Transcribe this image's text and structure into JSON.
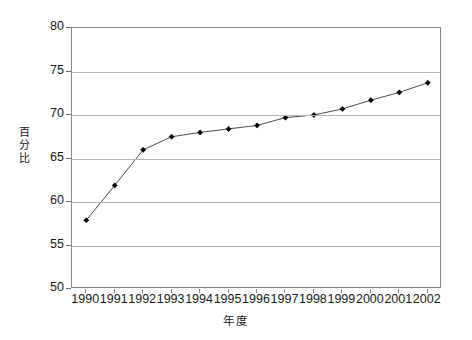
{
  "chart_data": {
    "type": "line",
    "title": "",
    "xlabel": "年度",
    "ylabel": "百分比",
    "categories": [
      "1990",
      "1991",
      "1992",
      "1993",
      "1994",
      "1995",
      "1996",
      "1997",
      "1998",
      "1999",
      "2000",
      "2001",
      "2002"
    ],
    "values": [
      57.9,
      61.9,
      66.0,
      67.5,
      68.0,
      68.4,
      68.8,
      69.7,
      70.0,
      70.7,
      71.7,
      72.6,
      73.7
    ],
    "series": [
      {
        "name": "百分比",
        "values": [
          57.9,
          61.9,
          66.0,
          67.5,
          68.0,
          68.4,
          68.8,
          69.7,
          70.0,
          70.7,
          71.7,
          72.6,
          73.7
        ]
      }
    ],
    "ylim": [
      50,
      80
    ],
    "ytick_labels": [
      "80",
      "75",
      "70",
      "65",
      "60",
      "55",
      "50"
    ],
    "ytick_values": [
      80,
      75,
      70,
      65,
      60,
      55,
      50
    ],
    "xlim": [
      "1990",
      "2002"
    ],
    "grid": "horizontal",
    "legend": "none",
    "marker": "diamond",
    "line_color": "#4d4d4d",
    "marker_color": "#000000",
    "grid_color": "#b4b4b4",
    "frame_color": "#8a8a8a",
    "background_color": "#ffffff"
  },
  "axes": {
    "y_title_chars": "百\n分\n比",
    "x_title": "年度"
  }
}
